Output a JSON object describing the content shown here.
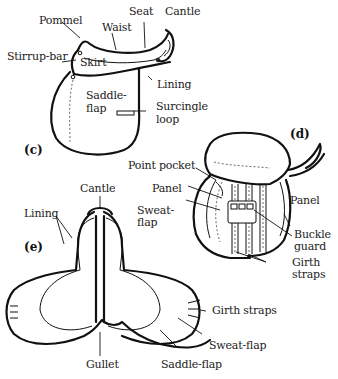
{
  "figure": {
    "panels": [
      {
        "id": "c",
        "tag": "(c)",
        "view": "side view of saddle",
        "labels": {
          "pommel": "Pommel",
          "waist": "Waist",
          "seat": "Seat",
          "cantle": "Cantle",
          "stirrup_bar": "Stirrup-bar",
          "skirt": "Skirt",
          "lining": "Lining",
          "saddle_flap_1": "Saddle-",
          "saddle_flap_2": "flap",
          "surcingle_loop_1": "Surcingle",
          "surcingle_loop_2": "loop"
        }
      },
      {
        "id": "d",
        "tag": "(d)",
        "view": "saddle with flap lifted",
        "labels": {
          "point_pocket": "Point pocket",
          "panel_left": "Panel",
          "sweat_flap_1": "Sweat-",
          "sweat_flap_2": "flap",
          "panel_right": "Panel",
          "buckle_guard_1": "Buckle",
          "buckle_guard_2": "guard",
          "girth_straps_1": "Girth",
          "girth_straps_2": "straps"
        }
      },
      {
        "id": "e",
        "tag": "(e)",
        "view": "underside of saddle",
        "labels": {
          "cantle": "Cantle",
          "lining": "Lining",
          "gullet": "Gullet",
          "girth_straps": "Girth straps",
          "sweat_flap": "Sweat-flap",
          "saddle_flap": "Saddle-flap"
        }
      }
    ]
  }
}
